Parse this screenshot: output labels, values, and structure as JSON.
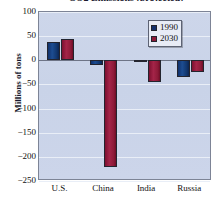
{
  "chart_data": {
    "type": "bar",
    "title": "CO2 Emissions (projected)",
    "xlabel": "",
    "ylabel": "Millions of tons",
    "categories": [
      "U.S.",
      "China",
      "India",
      "Russia"
    ],
    "series": [
      {
        "name": "1990",
        "color": "#14306d",
        "values": [
          38,
          -9,
          -2,
          -35
        ]
      },
      {
        "name": "2030",
        "color": "#8d1a38",
        "values": [
          44,
          -222,
          -45,
          -24
        ]
      }
    ],
    "ylim": [
      -250,
      100
    ],
    "yticks": [
      100,
      50,
      0,
      -50,
      -100,
      -150,
      -200,
      -250
    ],
    "ytick_labels": [
      "100",
      "50",
      "0",
      "−50",
      "−100",
      "−150",
      "−200",
      "−250"
    ],
    "grid": true,
    "legend_position": "top-right",
    "legend_entries": [
      "1990",
      "2030"
    ]
  }
}
